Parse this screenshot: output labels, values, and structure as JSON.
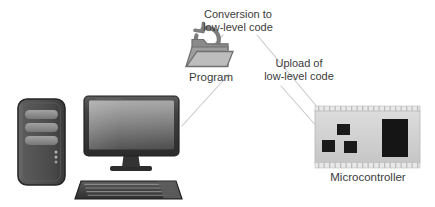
{
  "diagram": {
    "background_color": "#ffffff",
    "label_color": "#3b3b3b",
    "connector_color": "#c9c9c9",
    "labels": {
      "conversion": "Conversion to\nlow-level code",
      "upload": "Upload of\nlow-level code",
      "program": "Program",
      "microcontroller": "Microcontroller"
    },
    "nodes": [
      {
        "id": "computer",
        "name": "desktop-computer",
        "label": "",
        "parts": [
          "tower",
          "monitor",
          "keyboard"
        ]
      },
      {
        "id": "program",
        "name": "program-folder",
        "label": "Program",
        "icon": "folder-refresh-icon"
      },
      {
        "id": "microcontroller",
        "name": "microcontroller-board",
        "label": "Microcontroller",
        "chips": 4,
        "pin_headers": 2
      }
    ],
    "connectors": [
      {
        "from": "computer",
        "to": "program",
        "annotation": ""
      },
      {
        "from": "program",
        "to": "conversion",
        "annotation": "Conversion to low-level code"
      },
      {
        "from": "conversion",
        "to": "microcontroller",
        "annotation": ""
      },
      {
        "from": "upload",
        "to": "microcontroller",
        "annotation": "Upload of low-level code"
      }
    ],
    "colors": {
      "tower_body": "#4a4a4a",
      "tower_outline": "#2f2f2f",
      "tower_bay": "#8d8d8d",
      "monitor_bezel": "#3a3a3a",
      "screen_top": "#9b9b9b",
      "screen_bottom": "#4f4f4f",
      "keyboard": "#3c3c3c",
      "folder_gray": "#808080",
      "board_pcb": "#d2d2d2",
      "board_chip": "#1a1a1a",
      "board_pin": "#e8e8e8"
    }
  }
}
